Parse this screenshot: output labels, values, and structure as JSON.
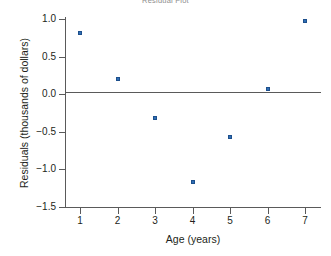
{
  "chart_data": {
    "type": "scatter",
    "title": "Residual Plot",
    "xlabel": "Age (years)",
    "ylabel": "Residuals (thousands of dollars)",
    "x": [
      1,
      2,
      3,
      4,
      5,
      6,
      7
    ],
    "values": [
      0.81,
      0.2,
      -0.31,
      -1.17,
      -0.57,
      0.07,
      0.97
    ],
    "series": [
      {
        "name": "Residuals",
        "values": [
          0.81,
          0.2,
          -0.31,
          -1.17,
          -0.57,
          0.07,
          0.97
        ]
      }
    ],
    "points": [
      {
        "x": 1,
        "y": 0.81
      },
      {
        "x": 2,
        "y": 0.2
      },
      {
        "x": 3,
        "y": -0.31
      },
      {
        "x": 4,
        "y": -1.17
      },
      {
        "x": 5,
        "y": -0.57
      },
      {
        "x": 6,
        "y": 0.07
      },
      {
        "x": 7,
        "y": 0.97
      }
    ],
    "xlim": [
      0.6,
      7.4
    ],
    "ylim": [
      -1.5,
      1.0
    ],
    "xticks": [
      1,
      2,
      3,
      4,
      5,
      6,
      7
    ],
    "xtick_labels": [
      "1",
      "2",
      "3",
      "4",
      "5",
      "6",
      "7"
    ],
    "yticks": [
      1.0,
      0.5,
      0.0,
      -0.5,
      -1.0,
      -1.5
    ],
    "ytick_labels": [
      "1.0",
      "0.5",
      "0.0",
      "−0.5",
      "−1.0",
      "−1.5"
    ],
    "grid": false,
    "legend": false,
    "reference_line": {
      "y": 0.0,
      "style": "solid"
    },
    "marker_color": "#2f6fb5",
    "axis_color": "#5a5a5a",
    "text_color": "#231f20",
    "background": "#ffffff"
  }
}
